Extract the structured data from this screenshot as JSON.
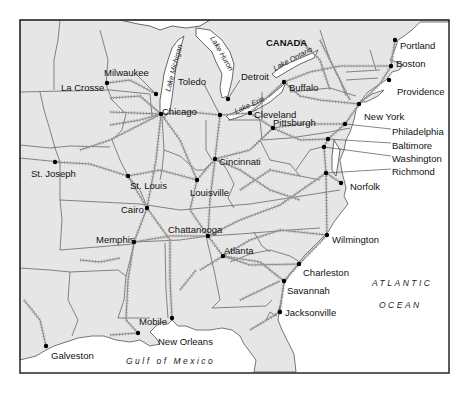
{
  "map": {
    "width": 469,
    "height": 398,
    "frame": {
      "x": 20,
      "y": 20,
      "w": 429,
      "h": 353
    },
    "colors": {
      "land": "#e6e6e6",
      "water": "#ffffff",
      "border": "#555555",
      "railroad": "#8a8a8a",
      "city_dot": "#000000",
      "text": "#111111"
    },
    "region_labels": [
      {
        "id": "canada",
        "text": "CANADA",
        "x": 266,
        "y": 46
      }
    ],
    "water_labels": [
      {
        "id": "atlantic-1",
        "text": "ATLANTIC",
        "x": 372,
        "y": 286
      },
      {
        "id": "atlantic-2",
        "text": "OCEAN",
        "x": 379,
        "y": 308
      },
      {
        "id": "gulf",
        "text": "Gulf of Mexico",
        "x": 126,
        "y": 364
      }
    ],
    "lake_labels": [
      {
        "id": "lake-michigan",
        "text": "Lake Michigan",
        "x": 170,
        "y": 92,
        "rotate": -75
      },
      {
        "id": "lake-huron",
        "text": "Lake Huron",
        "x": 210,
        "y": 38,
        "rotate": 60
      },
      {
        "id": "lake-erie",
        "text": "Lake Erie",
        "x": 236,
        "y": 114,
        "rotate": -25
      },
      {
        "id": "lake-ontario",
        "text": "Lake Ontario",
        "x": 275,
        "y": 71,
        "rotate": -28
      }
    ],
    "cities": [
      {
        "id": "portland",
        "name": "Portland",
        "dot": [
          395,
          40
        ],
        "label": [
          400,
          46
        ]
      },
      {
        "id": "boston",
        "name": "Boston",
        "dot": [
          391,
          66
        ],
        "label": [
          396,
          64
        ]
      },
      {
        "id": "providence",
        "name": "Providence",
        "dot": [
          389,
          80
        ],
        "label": [
          397,
          92
        ]
      },
      {
        "id": "milwaukee",
        "name": "Milwaukee",
        "dot": [
          156,
          94
        ],
        "label": [
          104,
          73
        ]
      },
      {
        "id": "la-crosse",
        "name": "La Crosse",
        "dot": [
          107,
          83
        ],
        "label": [
          61,
          88
        ]
      },
      {
        "id": "toledo",
        "name": "Toledo",
        "dot": [
          220,
          115
        ],
        "label": [
          178,
          82
        ]
      },
      {
        "id": "detroit",
        "name": "Detroit",
        "dot": [
          228,
          99
        ],
        "label": [
          241,
          77
        ]
      },
      {
        "id": "buffalo",
        "name": "Buffalo",
        "dot": [
          284,
          82
        ],
        "label": [
          289,
          88
        ]
      },
      {
        "id": "chicago",
        "name": "Chicago",
        "dot": [
          161,
          114
        ],
        "label": [
          162,
          112
        ]
      },
      {
        "id": "cleveland",
        "name": "Cleveland",
        "dot": [
          250,
          113
        ],
        "label": [
          254,
          115
        ]
      },
      {
        "id": "pittsburgh",
        "name": "Pittsburgh",
        "dot": [
          273,
          128
        ],
        "label": [
          273,
          123
        ]
      },
      {
        "id": "new-york",
        "name": "New York",
        "dot": [
          359,
          104
        ],
        "label": [
          364,
          117
        ]
      },
      {
        "id": "philadelphia",
        "name": "Philadelphia",
        "dot": [
          345,
          124
        ],
        "label": [
          392,
          132
        ]
      },
      {
        "id": "baltimore",
        "name": "Baltimore",
        "dot": [
          328,
          139
        ],
        "label": [
          392,
          146
        ]
      },
      {
        "id": "washington",
        "name": "Washington",
        "dot": [
          324,
          147
        ],
        "label": [
          392,
          159
        ]
      },
      {
        "id": "richmond",
        "name": "Richmond",
        "dot": [
          326,
          173
        ],
        "label": [
          392,
          172
        ]
      },
      {
        "id": "norfolk",
        "name": "Norfolk",
        "dot": [
          341,
          183
        ],
        "label": [
          350,
          187
        ]
      },
      {
        "id": "st-joseph",
        "name": "St. Joseph",
        "dot": [
          55,
          162
        ],
        "label": [
          31,
          174
        ]
      },
      {
        "id": "cincinnati",
        "name": "Cincinnati",
        "dot": [
          215,
          159
        ],
        "label": [
          219,
          162
        ]
      },
      {
        "id": "st-louis",
        "name": "St. Louis",
        "dot": [
          128,
          176
        ],
        "label": [
          130,
          186
        ]
      },
      {
        "id": "louisville",
        "name": "Louisville",
        "dot": [
          197,
          180
        ],
        "label": [
          190,
          193
        ]
      },
      {
        "id": "cairo",
        "name": "Cairo",
        "dot": [
          147,
          208
        ],
        "label": [
          121,
          210
        ]
      },
      {
        "id": "memphis",
        "name": "Memphis",
        "dot": [
          134,
          242
        ],
        "label": [
          96,
          240
        ]
      },
      {
        "id": "chattanooga",
        "name": "Chattanooga",
        "dot": [
          208,
          236
        ],
        "label": [
          168,
          230
        ]
      },
      {
        "id": "atlanta",
        "name": "Atlanta",
        "dot": [
          223,
          256
        ],
        "label": [
          224,
          251
        ]
      },
      {
        "id": "wilmington",
        "name": "Wilmington",
        "dot": [
          327,
          235
        ],
        "label": [
          332,
          240
        ]
      },
      {
        "id": "charleston",
        "name": "Charleston",
        "dot": [
          299,
          264
        ],
        "label": [
          303,
          273
        ]
      },
      {
        "id": "savannah",
        "name": "Savannah",
        "dot": [
          284,
          281
        ],
        "label": [
          287,
          291
        ]
      },
      {
        "id": "jacksonville",
        "name": "Jacksonville",
        "dot": [
          280,
          312
        ],
        "label": [
          285,
          313
        ]
      },
      {
        "id": "mobile",
        "name": "Mobile",
        "dot": [
          172,
          318
        ],
        "label": [
          139,
          322
        ]
      },
      {
        "id": "new-orleans",
        "name": "New Orleans",
        "dot": [
          138,
          333
        ],
        "label": [
          158,
          342
        ]
      },
      {
        "id": "galveston",
        "name": "Galveston",
        "dot": [
          46,
          346
        ],
        "label": [
          51,
          356
        ]
      }
    ]
  }
}
